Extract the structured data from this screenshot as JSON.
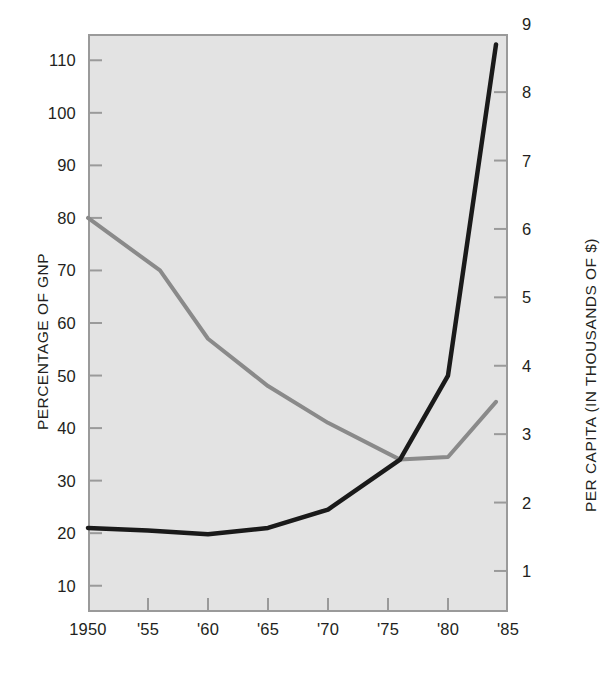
{
  "chart_data": {
    "type": "line",
    "title": "",
    "xlabel": "",
    "ylabel": "PERCENTAGE OF GNP",
    "y2label": "PER CAPITA (IN THOUSANDS OF $)",
    "grid": false,
    "legend": "none",
    "x": [
      1950,
      1955,
      1960,
      1965,
      1970,
      1975,
      1980,
      1985
    ],
    "xticklabels": [
      "1950",
      "'55",
      "'60",
      "'65",
      "'70",
      "'75",
      "'80",
      "'85"
    ],
    "xlim": [
      1950,
      1985
    ],
    "ylim": [
      5,
      115
    ],
    "yticks": [
      10,
      20,
      30,
      40,
      50,
      60,
      70,
      80,
      90,
      100,
      110
    ],
    "yticklabels": [
      "10",
      "20",
      "30",
      "40",
      "50",
      "60",
      "70",
      "80",
      "90",
      "100",
      "110"
    ],
    "y2lim": [
      0.4,
      8.85
    ],
    "y2ticks": [
      1,
      2,
      3,
      4,
      5,
      6,
      7,
      8,
      9
    ],
    "y2ticklabels": [
      "1",
      "2",
      "3",
      "4",
      "5",
      "6",
      "7",
      "8",
      "9"
    ],
    "series": [
      {
        "name": "percentage-of-gnp",
        "axis": "left",
        "color": "#8a8a8a",
        "points": [
          {
            "x": 1950,
            "y": 80
          },
          {
            "x": 1956,
            "y": 70
          },
          {
            "x": 1960,
            "y": 57
          },
          {
            "x": 1965,
            "y": 48
          },
          {
            "x": 1970,
            "y": 41
          },
          {
            "x": 1976,
            "y": 34
          },
          {
            "x": 1980,
            "y": 34.5
          },
          {
            "x": 1984,
            "y": 45
          }
        ]
      },
      {
        "name": "per-capita-thousands-of-dollars",
        "axis": "right",
        "color": "#1a1a1a",
        "points": [
          {
            "x": 1950,
            "y": 21
          },
          {
            "x": 1955,
            "y": 20.5
          },
          {
            "x": 1960,
            "y": 19.8
          },
          {
            "x": 1965,
            "y": 21
          },
          {
            "x": 1970,
            "y": 24.5
          },
          {
            "x": 1976,
            "y": 34
          },
          {
            "x": 1980,
            "y": 50
          },
          {
            "x": 1984,
            "y": 113
          }
        ]
      }
    ],
    "colors": {
      "plot_background": "#e3e3e3",
      "frame": "#9a9a9a",
      "gray_series": "#8a8a8a",
      "black_series": "#1a1a1a",
      "text": "#231f20"
    }
  }
}
